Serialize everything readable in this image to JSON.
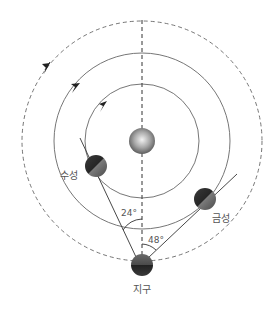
{
  "diagram": {
    "colors": {
      "orbit_line": "#666666",
      "dashed_line": "#555555",
      "label_text": "#555555",
      "planet_dark": "#2a2a2a",
      "planet_light": "#8a8a8a",
      "sun_light": "#eeeeee",
      "sun_dark": "#666666"
    },
    "bodies": {
      "sun": {
        "name": "",
        "cx": 142,
        "cy": 141,
        "r": 13
      },
      "mercury": {
        "name": "수성",
        "cx": 96,
        "cy": 166,
        "r": 11
      },
      "venus": {
        "name": "금성",
        "cx": 205,
        "cy": 199,
        "r": 11
      },
      "earth": {
        "name": "지구",
        "cx": 142,
        "cy": 265,
        "r": 11
      }
    },
    "orbits": {
      "mercury_orbit": {
        "r": 57,
        "style": "solid"
      },
      "venus_orbit": {
        "r": 88,
        "style": "solid"
      },
      "earth_orbit": {
        "r": 120,
        "style": "dashed"
      }
    },
    "angles": {
      "mercury_elongation": "24°",
      "venus_elongation": "48°"
    },
    "labels": {
      "mercury": "수성",
      "venus": "금성",
      "earth": "지구"
    }
  }
}
